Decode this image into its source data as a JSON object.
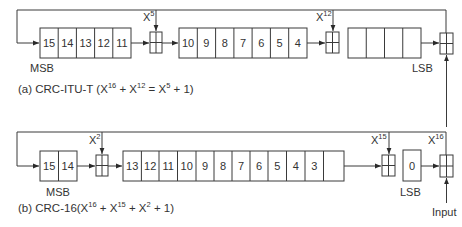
{
  "diagram_a": {
    "caption": {
      "prefix": "(a) CRC-ITU-T (X",
      "e1": "16",
      "p1": " + X",
      "e2": "12",
      "p2": " = X",
      "e3": "5",
      "p3": " + 1)"
    },
    "msb_label": "MSB",
    "lsb_label": "LSB",
    "group1_cells": [
      "15",
      "14",
      "13",
      "12",
      "11"
    ],
    "group2_cells": [
      "10",
      "9",
      "8",
      "7",
      "6",
      "5",
      "4"
    ],
    "group3_cells": [
      "",
      "",
      "",
      ""
    ],
    "xor_taps": [
      {
        "base": "X",
        "exp": "5"
      },
      {
        "base": "X",
        "exp": "12"
      }
    ]
  },
  "diagram_b": {
    "caption": {
      "prefix": "(b) CRC-16(X",
      "e1": "16",
      "p1": " + X",
      "e2": "15",
      "p2": " + X",
      "e3": "2",
      "p3": " + 1)"
    },
    "msb_label": "MSB",
    "lsb_label": "LSB",
    "input_label": "Input",
    "group1_cells": [
      "15",
      "14"
    ],
    "group2_cells": [
      "13",
      "12",
      "11",
      "10",
      "9",
      "8",
      "7",
      "6",
      "5",
      "4",
      "3",
      "2",
      "1"
    ],
    "group3_cells": [
      "0"
    ],
    "xor_taps": [
      {
        "base": "X",
        "exp": "2"
      },
      {
        "base": "X",
        "exp": "15"
      },
      {
        "base": "X",
        "exp": "16"
      }
    ]
  }
}
